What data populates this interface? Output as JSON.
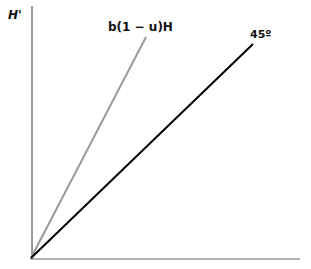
{
  "diagram": {
    "y_axis_label": "H'",
    "x_axis_label": "",
    "lines": [
      {
        "label": "b(1 − u)H",
        "color": "#9a9a9a",
        "description": "steeper gray line from origin"
      },
      {
        "label": "45º",
        "color": "#000000",
        "description": "45-degree line from origin"
      }
    ],
    "axis_color": "#555555"
  }
}
